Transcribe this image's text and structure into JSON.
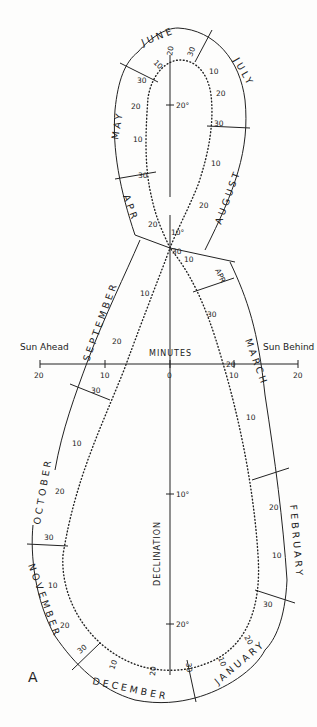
{
  "figure": {
    "panel_label": "A",
    "x_axis": {
      "title": "MINUTES",
      "left_label": "Sun Ahead",
      "right_label": "Sun Behind",
      "ticks": [
        "20",
        "10",
        "0",
        "10",
        "20"
      ]
    },
    "y_axis": {
      "title": "DECLINATION",
      "ticks": [
        "20°",
        "10°",
        "10°",
        "20°"
      ]
    },
    "months": {
      "june": "JUNE",
      "july": "JULY",
      "may": "MAY",
      "august": "AUGUST",
      "apr_top": "APR",
      "september": "SEPTEMBER",
      "apr_right": "APR",
      "march": "MARCH",
      "october": "OCTOBER",
      "february": "FEBRUARY",
      "november": "NOVEMBER",
      "january": "JANUARY",
      "december": "DECEMBER"
    },
    "day_marks": {
      "jun10": "10",
      "jun20": "20",
      "jun30": "30",
      "jul10": "10",
      "jul20": "20",
      "jul30": "30",
      "may30": "30",
      "may20": "20",
      "may10": "10",
      "aug10": "10",
      "aug20": "20",
      "apr30": "30",
      "apr20": "20",
      "apr10c": "10",
      "sep30c": "30",
      "sep10c": "10",
      "sep10": "10",
      "sep20": "20",
      "sep30": "30",
      "apr30r": "30",
      "mar20": "20",
      "mar10": "10",
      "oct10": "10",
      "oct20": "20",
      "oct30": "30",
      "feb20": "20",
      "feb10": "10",
      "jan30": "30",
      "nov10": "10",
      "nov20": "20",
      "nov30": "30",
      "jan20": "20",
      "jan10": "10",
      "dec10": "10",
      "dec20": "20",
      "dec30": "30"
    }
  }
}
